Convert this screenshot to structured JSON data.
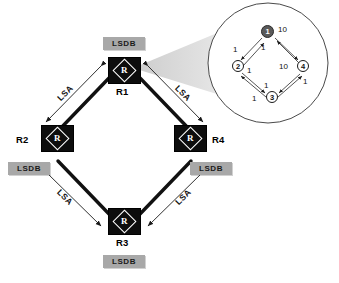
{
  "diagram": {
    "routers": [
      {
        "id": "R1",
        "label": "R1",
        "icon": "router-icon",
        "glyph": "R",
        "lsdb_label": "LSDB"
      },
      {
        "id": "R2",
        "label": "R2",
        "icon": "router-icon",
        "glyph": "R",
        "lsdb_label": "LSDB"
      },
      {
        "id": "R3",
        "label": "R3",
        "icon": "router-icon",
        "glyph": "R",
        "lsdb_label": "LSDB"
      },
      {
        "id": "R4",
        "label": "R4",
        "icon": "router-icon",
        "glyph": "R",
        "lsdb_label": "LSDB"
      }
    ],
    "links": [
      {
        "from": "R1",
        "to": "R2",
        "label": "LSA"
      },
      {
        "from": "R1",
        "to": "R4",
        "label": "LSA"
      },
      {
        "from": "R2",
        "to": "R3",
        "label": "LSA"
      },
      {
        "from": "R4",
        "to": "R3",
        "label": "LSA"
      }
    ],
    "magnifier": {
      "name": "magnifier-callout",
      "source_router": "R1",
      "graph": {
        "nodes": [
          {
            "id": "1",
            "label": "1",
            "filled": true
          },
          {
            "id": "2",
            "label": "2",
            "filled": false
          },
          {
            "id": "3",
            "label": "3",
            "filled": false
          },
          {
            "id": "4",
            "label": "4",
            "filled": false
          }
        ],
        "edge_weights": [
          {
            "name": "w-1-4-top",
            "value": "10"
          },
          {
            "name": "w-2-1",
            "value": "1"
          },
          {
            "name": "w-1-2",
            "value": "1"
          },
          {
            "name": "w-2-3",
            "value": "1"
          },
          {
            "name": "w-4-3-inner",
            "value": "10"
          },
          {
            "name": "w-4-3",
            "value": "1"
          },
          {
            "name": "w-3-4",
            "value": "1"
          },
          {
            "name": "w-3-2",
            "value": "1"
          }
        ]
      }
    },
    "colors": {
      "router_fill": "#0d0d0d",
      "lsdb_fill": "#a8a8a8",
      "node_filled": "#5a5a5a",
      "line": "#111111",
      "cone": "#d9d9d9"
    }
  }
}
